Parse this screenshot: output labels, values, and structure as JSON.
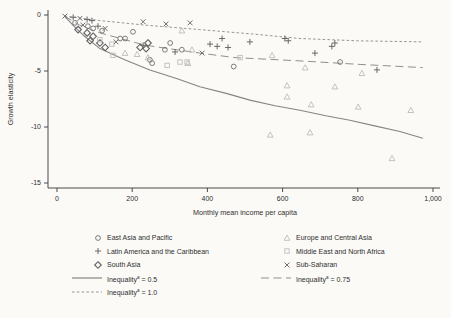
{
  "figure": {
    "background": "#fbfaf7",
    "axis_color": "#4a4a4a",
    "text_color": "#2f2f2f",
    "marker_dark": "#6e6e6e",
    "marker_light": "#bcbcbc",
    "line_color": "#8a8a8a"
  },
  "chart_data": {
    "type": "scatter",
    "title": "",
    "xlabel": "Monthly mean income per capita",
    "ylabel": "Growth elasticity",
    "xlim": [
      0,
      1000
    ],
    "ylim": [
      -15,
      0
    ],
    "grid": false,
    "legend_position": "bottom",
    "x_ticks": [
      {
        "v": 0,
        "label": "0"
      },
      {
        "v": 200,
        "label": "200"
      },
      {
        "v": 400,
        "label": "400"
      },
      {
        "v": 600,
        "label": "600"
      },
      {
        "v": 800,
        "label": "800"
      },
      {
        "v": 1000,
        "label": "1,000"
      }
    ],
    "y_ticks": [
      {
        "v": 0,
        "label": "0"
      },
      {
        "v": -5,
        "label": "-5"
      },
      {
        "v": -10,
        "label": "-10"
      },
      {
        "v": -15,
        "label": "-15"
      }
    ],
    "series": [
      {
        "name": "Inequality^a = 0.5",
        "kind": "line",
        "dash": "solid",
        "color": "#858585",
        "points": [
          [
            20,
            -0.1
          ],
          [
            45,
            -1.0
          ],
          [
            70,
            -1.8
          ],
          [
            114,
            -3.0
          ],
          [
            180,
            -4.0
          ],
          [
            247,
            -4.9
          ],
          [
            320,
            -5.7
          ],
          [
            380,
            -6.4
          ],
          [
            450,
            -7.0
          ],
          [
            513,
            -7.6
          ],
          [
            580,
            -8.1
          ],
          [
            646,
            -8.5
          ],
          [
            715,
            -9.0
          ],
          [
            779,
            -9.4
          ],
          [
            845,
            -9.9
          ],
          [
            912,
            -10.4
          ],
          [
            973,
            -11.0
          ]
        ]
      },
      {
        "name": "Inequality^a = 0.75",
        "kind": "line",
        "dash": "longdash",
        "color": "#8f8f8f",
        "points": [
          [
            20,
            -0.1
          ],
          [
            60,
            -0.9
          ],
          [
            114,
            -1.6
          ],
          [
            234,
            -2.7
          ],
          [
            380,
            -3.4
          ],
          [
            473,
            -3.8
          ],
          [
            646,
            -4.1
          ],
          [
            800,
            -4.4
          ],
          [
            973,
            -4.7
          ]
        ]
      },
      {
        "name": "Inequality^a = 1.0",
        "kind": "line",
        "dash": "shortdash",
        "color": "#969696",
        "points": [
          [
            20,
            -0.1
          ],
          [
            114,
            -0.5
          ],
          [
            234,
            -0.9
          ],
          [
            380,
            -1.3
          ],
          [
            520,
            -1.7
          ],
          [
            646,
            -2.1
          ],
          [
            800,
            -2.3
          ],
          [
            973,
            -2.4
          ]
        ]
      },
      {
        "name": "East Asia and Pacific",
        "kind": "scatter",
        "marker": "circle",
        "color": "#6e6e6e",
        "points": [
          [
            48,
            -0.7
          ],
          [
            82,
            -1.0
          ],
          [
            96,
            -1.2
          ],
          [
            120,
            -1.4
          ],
          [
            202,
            -1.5
          ],
          [
            168,
            -2.1
          ],
          [
            181,
            -2.1
          ],
          [
            287,
            -3.1
          ],
          [
            301,
            -2.5
          ],
          [
            332,
            -3.1
          ],
          [
            247,
            -4.0
          ],
          [
            253,
            -4.3
          ],
          [
            470,
            -4.6
          ],
          [
            753,
            -4.2
          ]
        ]
      },
      {
        "name": "Latin America and the Caribbean",
        "kind": "scatter",
        "marker": "plus",
        "color": "#686868",
        "points": [
          [
            43,
            -0.2
          ],
          [
            80,
            -0.4
          ],
          [
            93,
            -0.5
          ],
          [
            109,
            -1.0
          ],
          [
            229,
            -2.7
          ],
          [
            314,
            -3.3
          ],
          [
            407,
            -2.6
          ],
          [
            426,
            -2.8
          ],
          [
            439,
            -2.1
          ],
          [
            455,
            -2.9
          ],
          [
            513,
            -2.4
          ],
          [
            606,
            -2.1
          ],
          [
            615,
            -2.3
          ],
          [
            686,
            -3.4
          ],
          [
            731,
            -2.8
          ],
          [
            739,
            -2.5
          ],
          [
            851,
            -4.9
          ]
        ]
      },
      {
        "name": "South Asia",
        "kind": "scatter",
        "marker": "diamond",
        "color": "#606060",
        "points": [
          [
            56,
            -1.3
          ],
          [
            80,
            -1.6
          ],
          [
            88,
            -2.3
          ],
          [
            96,
            -1.9
          ],
          [
            114,
            -2.5
          ],
          [
            128,
            -2.9
          ],
          [
            221,
            -2.9
          ],
          [
            237,
            -3.0
          ],
          [
            242,
            -2.5
          ]
        ]
      },
      {
        "name": "Europe and Central Asia",
        "kind": "scatter",
        "marker": "triangle",
        "color": "#bcbcbc",
        "points": [
          [
            332,
            -1.4
          ],
          [
            181,
            -3.4
          ],
          [
            213,
            -3.5
          ],
          [
            242,
            -3.8
          ],
          [
            348,
            -4.3
          ],
          [
            359,
            -3.1
          ],
          [
            572,
            -3.6
          ],
          [
            660,
            -4.7
          ],
          [
            811,
            -5.2
          ],
          [
            612,
            -6.3
          ],
          [
            612,
            -7.3
          ],
          [
            739,
            -6.4
          ],
          [
            676,
            -8.0
          ],
          [
            801,
            -8.2
          ],
          [
            941,
            -8.5
          ],
          [
            567,
            -10.7
          ],
          [
            673,
            -10.5
          ],
          [
            891,
            -12.8
          ]
        ]
      },
      {
        "name": "Middle East and North Africa",
        "kind": "scatter",
        "marker": "square",
        "color": "#bdbdbd",
        "points": [
          [
            114,
            -2.2
          ],
          [
            146,
            -2.6
          ],
          [
            149,
            -3.6
          ],
          [
            293,
            -4.5
          ],
          [
            327,
            -4.2
          ],
          [
            346,
            -4.2
          ],
          [
            487,
            -3.8
          ]
        ]
      },
      {
        "name": "Sub-Saharan",
        "kind": "scatter",
        "marker": "x",
        "color": "#6e6e6e",
        "points": [
          [
            21,
            -0.1
          ],
          [
            61,
            -0.3
          ],
          [
            69,
            -0.9
          ],
          [
            128,
            -1.2
          ],
          [
            157,
            -2.4
          ],
          [
            229,
            -0.6
          ],
          [
            290,
            -0.8
          ],
          [
            354,
            -0.7
          ],
          [
            386,
            -3.4
          ]
        ]
      }
    ],
    "legend": {
      "columns": [
        {
          "items": [
            {
              "marker": "circle",
              "color": "#6e6e6e",
              "label": "East Asia and Pacific"
            },
            {
              "marker": "plus",
              "color": "#686868",
              "label": "Latin America and the Caribbean"
            },
            {
              "marker": "diamond",
              "color": "#606060",
              "label": "South Asia"
            },
            {
              "marker": "line-solid",
              "color": "#858585",
              "label": "Inequality",
              "sup": "a",
              "suffix": " = 0.5"
            },
            {
              "marker": "line-shortdash",
              "color": "#969696",
              "label": "Inequality",
              "sup": "a",
              "suffix": " = 1.0"
            }
          ]
        },
        {
          "items": [
            {
              "marker": "triangle",
              "color": "#bcbcbc",
              "label": "Europe and Central Asia"
            },
            {
              "marker": "square",
              "color": "#bdbdbd",
              "label": "Middle East and North Africa"
            },
            {
              "marker": "x",
              "color": "#6e6e6e",
              "label": "Sub-Saharan"
            },
            {
              "marker": "line-longdash",
              "color": "#8f8f8f",
              "label": "Inequality",
              "sup": "a",
              "suffix": " = 0.75"
            }
          ]
        }
      ]
    }
  }
}
